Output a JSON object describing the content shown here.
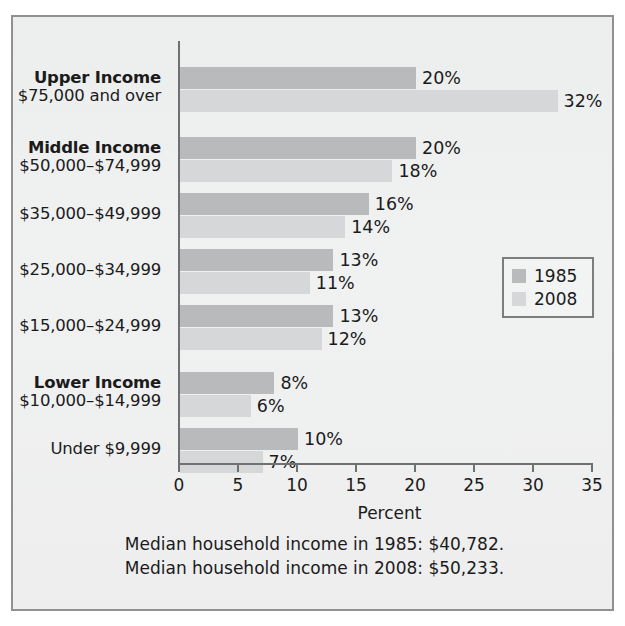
{
  "chart_data": {
    "type": "bar",
    "orientation": "horizontal",
    "title": "",
    "xlabel": "Percent",
    "ylabel": "",
    "xlim": [
      0,
      35
    ],
    "xticks": [
      0,
      5,
      10,
      15,
      20,
      25,
      30,
      35
    ],
    "xtick_labels": [
      "0",
      "5",
      "10",
      "15",
      "20",
      "25",
      "30",
      "35"
    ],
    "grid": false,
    "legend_position": "right-middle",
    "categories": [
      "$75,000 and over",
      "$50,000–$74,999",
      "$35,000–$49,999",
      "$25,000–$34,999",
      "$15,000–$24,999",
      "$10,000–$14,999",
      "Under $9,999"
    ],
    "category_groups": [
      "Upper Income",
      "Middle Income",
      "",
      "",
      "",
      "Lower Income",
      ""
    ],
    "series": [
      {
        "name": "1985",
        "color": "#b9babb",
        "values": [
          20,
          20,
          16,
          13,
          13,
          8,
          10
        ]
      },
      {
        "name": "2008",
        "color": "#d6d7d8",
        "values": [
          32,
          18,
          14,
          11,
          12,
          6,
          7
        ]
      }
    ],
    "value_labels": {
      "1985": [
        "20%",
        "20%",
        "16%",
        "13%",
        "13%",
        "8%",
        "10%"
      ],
      "2008": [
        "32%",
        "18%",
        "14%",
        "11%",
        "12%",
        "6%",
        "7%"
      ]
    },
    "annotations": [
      "Median household income in 1985: $40,782.",
      "Median household income in 2008: $50,233."
    ]
  },
  "axis": {
    "x_title": "Percent",
    "ticks": [
      "0",
      "5",
      "10",
      "15",
      "20",
      "25",
      "30",
      "35"
    ]
  },
  "legend": {
    "items": [
      {
        "label": "1985",
        "color": "#b9babb"
      },
      {
        "label": "2008",
        "color": "#d6d7d8"
      }
    ]
  },
  "categories": [
    {
      "group": "Upper Income",
      "range": "$75,000 and over"
    },
    {
      "group": "Middle Income",
      "range": "$50,000–$74,999"
    },
    {
      "group": "",
      "range": "$35,000–$49,999"
    },
    {
      "group": "",
      "range": "$25,000–$34,999"
    },
    {
      "group": "",
      "range": "$15,000–$24,999"
    },
    {
      "group": "Lower Income",
      "range": "$10,000–$14,999"
    },
    {
      "group": "",
      "range": "Under $9,999"
    }
  ],
  "footnotes": [
    "Median household income in 1985: $40,782.",
    "Median household income in 2008: $50,233."
  ],
  "colors": {
    "series_1985": "#b9babb",
    "series_2008": "#d6d7d8",
    "axis": "#6e7072",
    "frame": "#8e9091",
    "background": "#ecedee",
    "text": "#1b1b1b"
  }
}
